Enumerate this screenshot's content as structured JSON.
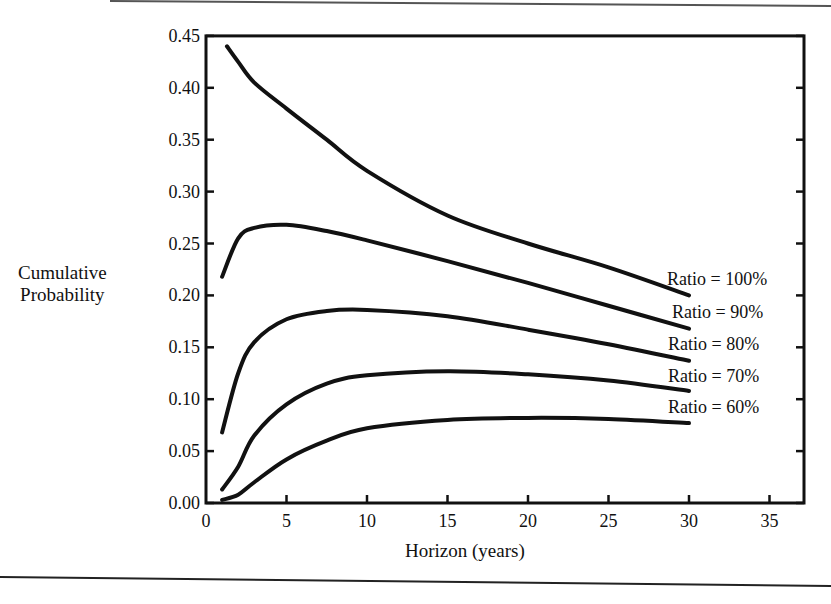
{
  "chart_data": {
    "type": "line",
    "title": "",
    "xlabel": "Horizon (years)",
    "ylabel": "Cumulative Probability",
    "ylabel_lines": [
      "Cumulative",
      "Probability"
    ],
    "xlim": [
      0,
      37
    ],
    "ylim": [
      0,
      0.45
    ],
    "x_ticks": [
      0,
      5,
      10,
      15,
      20,
      25,
      30,
      35
    ],
    "x_tick_labels": [
      "0",
      "5",
      "10",
      "15",
      "20",
      "25",
      "30",
      "35"
    ],
    "y_ticks": [
      0,
      0.05,
      0.1,
      0.15,
      0.2,
      0.25,
      0.3,
      0.35,
      0.4,
      0.45
    ],
    "y_tick_labels": [
      "0.00",
      "0.05",
      "0.10",
      "0.15",
      "0.20",
      "0.25",
      "0.30",
      "0.35",
      "0.40",
      "0.45"
    ],
    "grid": false,
    "legend_position": "inline-right",
    "series": [
      {
        "name": "Ratio = 100%",
        "x": [
          1.3,
          2,
          3,
          5,
          7.5,
          10,
          15,
          20,
          25,
          30
        ],
        "values": [
          0.44,
          0.425,
          0.405,
          0.38,
          0.35,
          0.32,
          0.277,
          0.25,
          0.227,
          0.2
        ]
      },
      {
        "name": "Ratio = 90%",
        "x": [
          1,
          2,
          3,
          5,
          7.5,
          10,
          15,
          20,
          25,
          30
        ],
        "values": [
          0.218,
          0.255,
          0.265,
          0.268,
          0.262,
          0.253,
          0.233,
          0.212,
          0.19,
          0.168
        ]
      },
      {
        "name": "Ratio = 80%",
        "x": [
          1,
          2,
          3,
          5,
          7.5,
          10,
          15,
          20,
          25,
          30
        ],
        "values": [
          0.068,
          0.125,
          0.155,
          0.177,
          0.185,
          0.186,
          0.18,
          0.167,
          0.153,
          0.137
        ]
      },
      {
        "name": "Ratio = 70%",
        "x": [
          1,
          2,
          3,
          5,
          7.5,
          10,
          15,
          20,
          25,
          30
        ],
        "values": [
          0.013,
          0.035,
          0.065,
          0.095,
          0.115,
          0.123,
          0.127,
          0.124,
          0.118,
          0.108
        ]
      },
      {
        "name": "Ratio = 60%",
        "x": [
          1,
          2,
          3,
          5,
          7.5,
          10,
          15,
          20,
          25,
          30
        ],
        "values": [
          0.003,
          0.008,
          0.02,
          0.042,
          0.06,
          0.072,
          0.08,
          0.082,
          0.081,
          0.077
        ]
      }
    ],
    "line_color": "#111111"
  }
}
